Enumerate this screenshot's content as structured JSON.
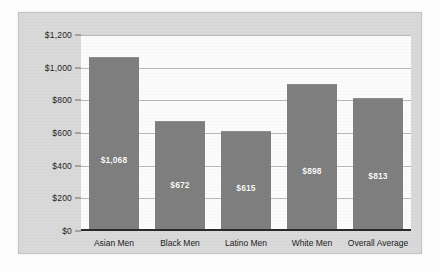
{
  "chart_data": {
    "type": "bar",
    "title": "",
    "subtitle": "",
    "xlabel": "",
    "ylabel": "",
    "categories": [
      "Asian Men",
      "Black Men",
      "Latino Men",
      "White Men",
      "Overall Average"
    ],
    "values": [
      1068,
      672,
      615,
      898,
      813
    ],
    "data_labels": [
      "$1,068",
      "$672",
      "$615",
      "$898",
      "$813"
    ],
    "ylim": [
      0,
      1200
    ],
    "ytick_values": [
      0,
      200,
      400,
      600,
      800,
      1000,
      1200
    ],
    "ytick_labels": [
      "$0",
      "$200",
      "$400",
      "$600",
      "$800",
      "$1,000",
      "$1,200"
    ],
    "grid": true,
    "legend": false,
    "legend_position": "none",
    "orientation": "vertical",
    "colors": {
      "bar_fill": "#7f7f7f",
      "panel_background": "#d9d9d9",
      "plot_background": "#fbfbfb",
      "gridline": "#b9b9b9",
      "axis_line": "#2a2a2a",
      "tick_text": "#1d1d1d",
      "data_label_text": "#ffffff"
    }
  }
}
